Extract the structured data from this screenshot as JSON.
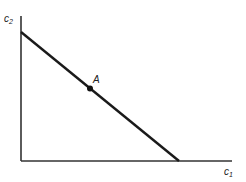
{
  "diagram": {
    "type": "budget-constraint",
    "y_axis_label": "c",
    "y_axis_subscript": "2",
    "x_axis_label": "c",
    "x_axis_subscript": "1",
    "point_label": "A",
    "line_color": "#1a1a1a",
    "axis_color": "#333333"
  }
}
